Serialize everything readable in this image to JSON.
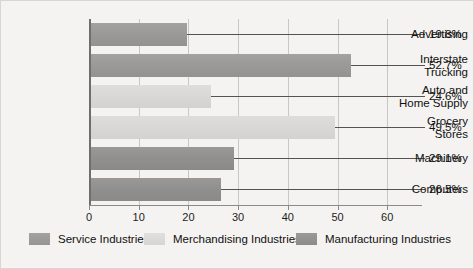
{
  "chart_data": {
    "type": "bar",
    "orientation": "horizontal",
    "title": "",
    "xlabel": "",
    "ylabel": "",
    "xlim": [
      0,
      67
    ],
    "xticks": [
      "0",
      "10",
      "20",
      "30",
      "40",
      "50",
      "60"
    ],
    "xtick_values": [
      0,
      10,
      20,
      30,
      40,
      50,
      60
    ],
    "grid": true,
    "legend_position": "bottom",
    "categories": [
      "Advertising",
      "Interstate Trucking",
      "Auto and Home Supply",
      "Grocery Stores",
      "Machinery",
      "Computers"
    ],
    "values": [
      19.8,
      52.7,
      24.6,
      49.5,
      29.1,
      26.5
    ],
    "value_labels": [
      "19.8%",
      "52.7%",
      "24.6%",
      "49.5%",
      "29.1%",
      "26.5%"
    ],
    "series_of_bar": [
      "Service Industries",
      "Service Industries",
      "Merchandising Industries",
      "Merchandising Industries",
      "Manufacturing Industries",
      "Manufacturing Industries"
    ],
    "series": [
      {
        "name": "Service Industries",
        "color": "#9b9a98"
      },
      {
        "name": "Merchandising Industries",
        "color": "#d9d8d6"
      },
      {
        "name": "Manufacturing Industries",
        "color": "#919090"
      }
    ]
  },
  "bars": [
    {
      "label_line1": "Advertising",
      "label_line2": "",
      "value": 19.8,
      "value_label": "19.8%",
      "series": "service"
    },
    {
      "label_line1": "Interstate",
      "label_line2": "Trucking",
      "value": 52.7,
      "value_label": "52.7%",
      "series": "service"
    },
    {
      "label_line1": "Auto and",
      "label_line2": "Home Supply",
      "value": 24.6,
      "value_label": "24.6%",
      "series": "merchandising"
    },
    {
      "label_line1": "Grocery",
      "label_line2": "Stores",
      "value": 49.5,
      "value_label": "49.5%",
      "series": "merchandising"
    },
    {
      "label_line1": "Machinery",
      "label_line2": "",
      "value": 29.1,
      "value_label": "29.1%",
      "series": "manufacturing"
    },
    {
      "label_line1": "Computers",
      "label_line2": "",
      "value": 26.5,
      "value_label": "26.5%",
      "series": "manufacturing"
    }
  ],
  "axis": {
    "ticks": [
      "0",
      "10",
      "20",
      "30",
      "40",
      "50",
      "60"
    ]
  },
  "legend": {
    "items": [
      {
        "label": "Service Industries",
        "swatch": "service"
      },
      {
        "label": "Merchandising Industries",
        "swatch": "merchandising"
      },
      {
        "label": "Manufacturing Industries",
        "swatch": "manufacturing"
      }
    ]
  }
}
